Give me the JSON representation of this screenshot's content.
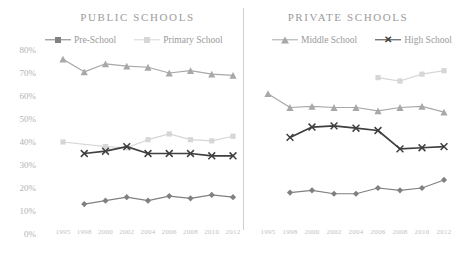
{
  "panels": {
    "public": {
      "title": "PUBLIC SCHOOLS"
    },
    "private": {
      "title": "PRIVATE SCHOOLS"
    }
  },
  "legend": {
    "public": [
      {
        "label": "Pre-School",
        "marker": "diamond",
        "color": "#808080"
      },
      {
        "label": "Primary School",
        "marker": "square",
        "color": "#d6d6d6"
      }
    ],
    "private": [
      {
        "label": "Middle School",
        "marker": "triangle",
        "color": "#a8a8a8"
      },
      {
        "label": "High School",
        "marker": "x",
        "color": "#3f3f3f"
      }
    ]
  },
  "axes": {
    "y_ticks": [
      "80%",
      "70%",
      "60%",
      "50%",
      "40%",
      "30%",
      "20%",
      "10%",
      "0%"
    ],
    "x_ticks": [
      "1995",
      "1998",
      "2000",
      "2002",
      "2004",
      "2006",
      "2008",
      "2010",
      "2012"
    ]
  },
  "colors": {
    "pre_school": "#808080",
    "primary_school": "#d6d6d6",
    "middle_school": "#a8a8a8",
    "high_school": "#3f3f3f",
    "axis_text": "#b2b2b2",
    "title_text": "#9b9b9b",
    "divider": "#cfcfcf"
  },
  "chart_data": {
    "type": "line",
    "xlabel": "",
    "ylabel": "",
    "ylim": [
      0,
      85
    ],
    "yticks": [
      0,
      10,
      20,
      30,
      40,
      50,
      60,
      70,
      80
    ],
    "grid": false,
    "legend_position": "top",
    "x": [
      1995,
      1998,
      2000,
      2002,
      2004,
      2006,
      2008,
      2010,
      2012
    ],
    "panels": [
      {
        "name": "PUBLIC SCHOOLS",
        "series": [
          {
            "name": "Pre-School",
            "marker": "diamond",
            "color": "#808080",
            "values": [
              null,
              13,
              14.5,
              16,
              14.5,
              16.5,
              15.5,
              17,
              16
            ]
          },
          {
            "name": "Primary School",
            "marker": "square",
            "color": "#d6d6d6",
            "values": [
              40,
              null,
              38,
              37.5,
              41,
              43.5,
              41,
              40.5,
              42.5
            ]
          },
          {
            "name": "Middle School",
            "marker": "triangle",
            "color": "#a8a8a8",
            "values": [
              76,
              70.5,
              74,
              73,
              72.5,
              70,
              71,
              69.5,
              69
            ]
          },
          {
            "name": "High School",
            "marker": "x",
            "color": "#3f3f3f",
            "values": [
              null,
              35,
              36,
              38,
              35,
              35,
              35,
              34,
              34
            ]
          }
        ]
      },
      {
        "name": "PRIVATE SCHOOLS",
        "series": [
          {
            "name": "Pre-School",
            "marker": "diamond",
            "color": "#808080",
            "values": [
              null,
              18,
              19,
              17.5,
              17.5,
              20,
              19,
              20,
              23.5
            ]
          },
          {
            "name": "Primary School",
            "marker": "square",
            "color": "#d6d6d6",
            "values": [
              null,
              null,
              null,
              null,
              null,
              68,
              66.5,
              69.5,
              71
            ]
          },
          {
            "name": "Middle School",
            "marker": "triangle",
            "color": "#a8a8a8",
            "values": [
              61,
              55,
              55.5,
              55,
              55,
              53.5,
              55,
              55.5,
              53
            ]
          },
          {
            "name": "High School",
            "marker": "x",
            "color": "#3f3f3f",
            "values": [
              null,
              42,
              46.5,
              47,
              46,
              45,
              37,
              37.5,
              38
            ]
          }
        ]
      }
    ]
  }
}
